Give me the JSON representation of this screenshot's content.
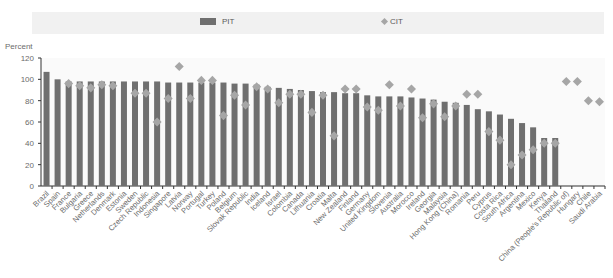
{
  "chart_data": {
    "type": "bar",
    "title": "",
    "xlabel": "",
    "ylabel": "Percent",
    "ylim": [
      0,
      120
    ],
    "yticks": [
      0,
      20,
      40,
      60,
      80,
      100,
      120
    ],
    "grid": false,
    "legend_position": "top",
    "categories": [
      "Brazil",
      "Spain",
      "France",
      "Bulgaria",
      "Greece",
      "Netherlands",
      "Denmark",
      "Estonia",
      "Sweden",
      "Czech Republic",
      "Indonesia",
      "Singapore",
      "Latvia",
      "Norway",
      "Portugal",
      "Turkey",
      "Poland",
      "Belgium",
      "Slovak Republic",
      "India",
      "Iceland",
      "Israel",
      "Colombia",
      "Canada",
      "Lithuania",
      "Croatia",
      "Malta",
      "New Zealand",
      "Finland",
      "Germany",
      "United Kingdom",
      "Slovenia",
      "Australia",
      "Morocco",
      "Ireland",
      "Georgia",
      "Malaysia",
      "Hong Kong (China)",
      "Romania",
      "Peru",
      "Cyprus",
      "Costa Rica",
      "South Africa",
      "Argentina",
      "Mexico",
      "Kenya",
      "Thailand",
      "China (People's Republic of)",
      "Hungary",
      "Chile",
      "Saudi Arabia"
    ],
    "series": [
      {
        "name": "PIT",
        "type": "bar",
        "color": "#6f6f6f",
        "values": [
          107,
          100,
          98,
          98,
          98,
          98,
          98,
          98,
          98,
          98,
          98,
          97,
          97,
          97,
          97,
          97,
          97,
          96,
          96,
          95,
          93,
          92,
          91,
          90,
          89,
          88,
          88,
          87,
          87,
          85,
          84,
          84,
          84,
          83,
          82,
          81,
          79,
          78,
          76,
          72,
          70,
          67,
          63,
          59,
          55,
          45,
          45,
          null,
          null,
          null,
          null
        ]
      },
      {
        "name": "CIT",
        "type": "scatter",
        "marker": "diamond",
        "color": "#a6a6a6",
        "values": [
          null,
          null,
          96,
          94,
          92,
          95,
          94,
          null,
          87,
          87,
          60,
          82,
          112,
          82,
          99,
          99,
          66,
          85,
          76,
          93,
          91,
          78,
          86,
          86,
          69,
          85,
          47,
          91,
          91,
          74,
          71,
          95,
          75,
          91,
          64,
          77,
          65,
          75,
          86,
          86,
          51,
          43,
          20,
          29,
          34,
          40,
          40,
          98,
          98,
          80,
          79
        ]
      }
    ]
  },
  "legend": {
    "pit_label": "PIT",
    "cit_label": "CIT"
  },
  "axis": {
    "y_title": "Percent",
    "ticks": [
      "120",
      "100",
      "80",
      "60",
      "40",
      "20",
      "0"
    ]
  }
}
